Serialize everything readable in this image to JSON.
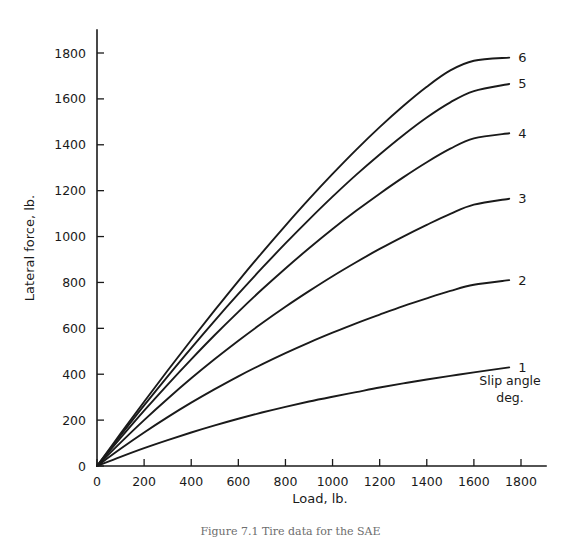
{
  "figure": {
    "caption": "Figure 7.1  Tire data for the SAE",
    "background_color": "#ffffff",
    "line_color": "#1a1a1a"
  },
  "chart_data": {
    "type": "line",
    "title": "",
    "xlabel": "Load, lb.",
    "ylabel": "Lateral force, lb.",
    "xlim": [
      0,
      1800
    ],
    "ylim": [
      0,
      1900
    ],
    "xticks": [
      0,
      200,
      400,
      600,
      800,
      1000,
      1200,
      1400,
      1600,
      1800
    ],
    "yticks": [
      0,
      200,
      400,
      600,
      800,
      1000,
      1200,
      1400,
      1600,
      1800
    ],
    "xtick_labels": [
      "0",
      "200",
      "400",
      "600",
      "800",
      "1000",
      "1200",
      "1400",
      "1600",
      "1800"
    ],
    "ytick_labels": [
      "0",
      "200",
      "400",
      "600",
      "800",
      "1000",
      "1200",
      "1400",
      "1600",
      "1800"
    ],
    "grid": false,
    "legend_position": "right-inline",
    "legend_title": "Slip angle\ndeg.",
    "legend_title_line1": "Slip angle",
    "legend_title_line2": "deg.",
    "series": [
      {
        "name": "1",
        "label": "1",
        "slip_angle_deg": 1,
        "x": [
          0,
          100,
          200,
          300,
          400,
          500,
          600,
          700,
          800,
          900,
          1000,
          1100,
          1200,
          1300,
          1400,
          1500,
          1600,
          1750
        ],
        "values": [
          0,
          40,
          78,
          113,
          146,
          177,
          206,
          233,
          258,
          281,
          302,
          322,
          342,
          360,
          377,
          393,
          408,
          430
        ]
      },
      {
        "name": "2",
        "label": "2",
        "slip_angle_deg": 2,
        "x": [
          0,
          100,
          200,
          300,
          400,
          500,
          600,
          700,
          800,
          900,
          1000,
          1100,
          1200,
          1300,
          1400,
          1500,
          1600,
          1750
        ],
        "values": [
          0,
          75,
          146,
          213,
          276,
          335,
          391,
          443,
          492,
          538,
          581,
          622,
          660,
          697,
          731,
          763,
          790,
          810
        ]
      },
      {
        "name": "3",
        "label": "3",
        "slip_angle_deg": 3,
        "x": [
          0,
          100,
          200,
          300,
          400,
          500,
          600,
          700,
          800,
          900,
          1000,
          1100,
          1200,
          1300,
          1400,
          1500,
          1600,
          1750
        ],
        "values": [
          0,
          102,
          200,
          293,
          382,
          466,
          546,
          622,
          694,
          762,
          827,
          888,
          946,
          1000,
          1051,
          1099,
          1139,
          1165
        ]
      },
      {
        "name": "4",
        "label": "4",
        "slip_angle_deg": 4,
        "x": [
          0,
          100,
          200,
          300,
          400,
          500,
          600,
          700,
          800,
          900,
          1000,
          1100,
          1200,
          1300,
          1400,
          1500,
          1600,
          1750
        ],
        "values": [
          0,
          122,
          241,
          355,
          465,
          571,
          672,
          769,
          861,
          949,
          1033,
          1112,
          1187,
          1258,
          1324,
          1383,
          1428,
          1450
        ]
      },
      {
        "name": "5",
        "label": "5",
        "slip_angle_deg": 5,
        "x": [
          0,
          100,
          200,
          300,
          400,
          500,
          600,
          700,
          800,
          900,
          1000,
          1100,
          1200,
          1300,
          1400,
          1500,
          1600,
          1750
        ],
        "values": [
          0,
          133,
          264,
          391,
          514,
          634,
          750,
          862,
          970,
          1074,
          1174,
          1269,
          1358,
          1442,
          1519,
          1585,
          1634,
          1665
        ]
      },
      {
        "name": "6",
        "label": "6",
        "slip_angle_deg": 6,
        "x": [
          0,
          100,
          200,
          300,
          400,
          500,
          600,
          700,
          800,
          900,
          1000,
          1100,
          1200,
          1300,
          1400,
          1500,
          1600,
          1750
        ],
        "values": [
          0,
          141,
          280,
          416,
          549,
          679,
          806,
          929,
          1048,
          1163,
          1273,
          1378,
          1477,
          1569,
          1653,
          1724,
          1766,
          1780
        ]
      }
    ]
  }
}
